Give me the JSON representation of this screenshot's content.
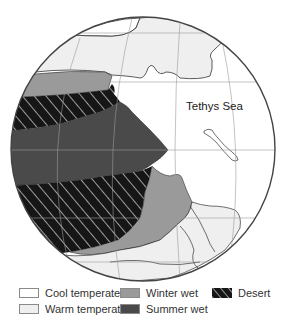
{
  "map": {
    "title": "",
    "projection": "orthographic globe",
    "labels": [
      {
        "text": "Tethys Sea",
        "x": 185,
        "y": 108
      }
    ]
  },
  "legend": {
    "items": [
      {
        "key": "cool_temperate",
        "label": "Cool temperate",
        "color": "#ffffff"
      },
      {
        "key": "warm_temperate",
        "label": "Warm temperate",
        "color": "#efefef"
      },
      {
        "key": "winter_wet",
        "label": "Winter wet",
        "color": "#9a9a9a"
      },
      {
        "key": "summer_wet",
        "label": "Summer wet",
        "color": "#4a4a4a"
      },
      {
        "key": "desert",
        "label": "Desert",
        "color": "#161616",
        "pattern": "white diagonal hatch"
      }
    ]
  },
  "colors": {
    "ocean": "#ffffff",
    "graticule": "#9a9a9a",
    "coast": "#333333",
    "globe_outline": "#444444"
  }
}
